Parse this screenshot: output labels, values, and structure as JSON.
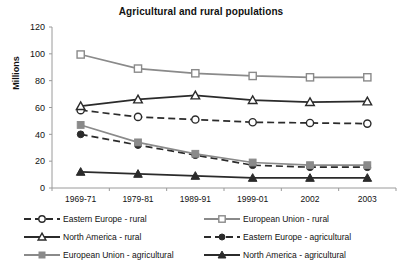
{
  "chart_data": {
    "type": "line",
    "title": "Agricultural and rural populations",
    "xlabel": "",
    "ylabel": "Millions",
    "categories": [
      "1969-71",
      "1979-81",
      "1989-91",
      "1999-01",
      "2002",
      "2003"
    ],
    "ylim": [
      0,
      120
    ],
    "yticks": [
      0,
      20,
      40,
      60,
      80,
      100,
      120
    ],
    "grid": false,
    "legend_position": "bottom",
    "series": [
      {
        "name": "Eastern Europe - rural",
        "values": [
          58,
          53,
          51,
          49,
          48.5,
          48
        ],
        "marker": "open-circle",
        "line_style": "dashed",
        "color": "#2b2b2b"
      },
      {
        "name": "European Union - rural",
        "values": [
          99.5,
          89,
          85.5,
          83.5,
          82.5,
          82.5
        ],
        "marker": "open-square",
        "line_style": "solid",
        "color": "#8a8a8a"
      },
      {
        "name": "North America - rural",
        "values": [
          61,
          66,
          69,
          65.5,
          64,
          64.5
        ],
        "marker": "open-triangle",
        "line_style": "solid",
        "color": "#2b2b2b"
      },
      {
        "name": "Eastern Europe - agricultural",
        "values": [
          40,
          32,
          24.5,
          17,
          15.5,
          15.5
        ],
        "marker": "filled-circle",
        "line_style": "dashed",
        "color": "#2b2b2b"
      },
      {
        "name": "European Union - agricultural",
        "values": [
          47,
          34,
          25.5,
          19,
          17,
          17
        ],
        "marker": "filled-square",
        "line_style": "solid",
        "color": "#8a8a8a"
      },
      {
        "name": "North America - agricultural",
        "values": [
          12,
          10.5,
          9,
          7.5,
          7.5,
          7.5
        ],
        "marker": "filled-triangle",
        "line_style": "solid",
        "color": "#2b2b2b"
      }
    ]
  },
  "legend": {
    "items": [
      {
        "label": "Eastern Europe - rural"
      },
      {
        "label": "European Union - rural"
      },
      {
        "label": "North America - rural"
      },
      {
        "label": "Eastern Europe - agricultural"
      },
      {
        "label": "European Union - agricultural"
      },
      {
        "label": "North America - agricultural"
      }
    ]
  },
  "colors": {
    "dark": "#2b2b2b",
    "gray": "#8a8a8a",
    "axis": "#9a9a9a",
    "text": "#111111",
    "background": "#ffffff"
  }
}
